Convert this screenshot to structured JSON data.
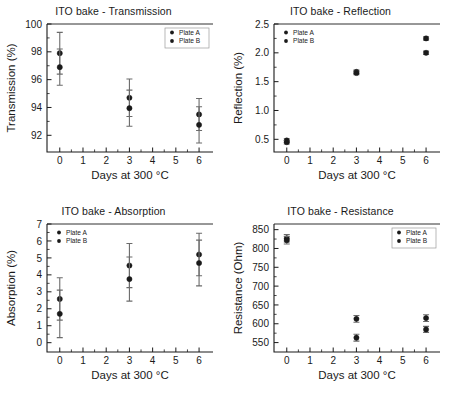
{
  "figure": {
    "width": 454,
    "height": 400,
    "background": "#ffffff",
    "marker_color": "#1a1a1a",
    "errorbar_color": "#6b6b6b",
    "axis_color": "#1a1a1a",
    "series_names": [
      "Plate A",
      "Plate B"
    ],
    "shared_xlabel": "Days at 300 °C"
  },
  "chart_data": [
    {
      "type": "scatter",
      "id": "transmission",
      "title": "ITO bake - Transmission",
      "xlabel": "Days at 300 °C",
      "ylabel": "Transmission (%)",
      "xlim": [
        -0.55,
        6.6
      ],
      "ylim": [
        90.8,
        100
      ],
      "xticks": [
        0,
        1,
        2,
        3,
        4,
        5,
        6
      ],
      "yticks": [
        92,
        94,
        96,
        98,
        100
      ],
      "ytick_labels": [
        "92",
        "94",
        "96",
        "98",
        "100"
      ],
      "grid": false,
      "legend": {
        "position": "top-right",
        "entries": [
          "Plate A",
          "Plate B"
        ]
      },
      "x": [
        0,
        3,
        6
      ],
      "series": [
        {
          "name": "Plate A",
          "values": [
            97.9,
            94.7,
            93.5
          ],
          "errors": [
            1.5,
            1.35,
            1.15
          ]
        },
        {
          "name": "Plate B",
          "values": [
            96.9,
            93.95,
            92.75
          ],
          "errors": [
            1.3,
            1.3,
            1.3
          ]
        }
      ]
    },
    {
      "type": "scatter",
      "id": "reflection",
      "title": "ITO bake - Reflection",
      "xlabel": "Days at 300 °C",
      "ylabel": "Reflection (%)",
      "xlim": [
        -0.55,
        6.6
      ],
      "ylim": [
        0.28,
        2.5
      ],
      "xticks": [
        0,
        1,
        2,
        3,
        4,
        5,
        6
      ],
      "yticks": [
        0.5,
        1.0,
        1.5,
        2.0,
        2.5
      ],
      "ytick_labels": [
        "0.5",
        "1.0",
        "1.5",
        "2.0",
        "2.5"
      ],
      "grid": false,
      "legend": {
        "position": "top-left",
        "entries": [
          "Plate A",
          "Plate B"
        ]
      },
      "x": [
        0,
        3,
        6
      ],
      "series": [
        {
          "name": "Plate A",
          "values": [
            0.48,
            1.67,
            2.25
          ],
          "errors": [
            0.03,
            0.03,
            0.03
          ]
        },
        {
          "name": "Plate B",
          "values": [
            0.45,
            1.65,
            2.0
          ],
          "errors": [
            0.03,
            0.03,
            0.03
          ]
        }
      ]
    },
    {
      "type": "scatter",
      "id": "absorption",
      "title": "ITO bake - Absorption",
      "xlabel": "Days at 300 °C",
      "ylabel": "Absorption (%)",
      "xlim": [
        -0.55,
        6.6
      ],
      "ylim": [
        -0.55,
        7
      ],
      "xticks": [
        0,
        1,
        2,
        3,
        4,
        5,
        6
      ],
      "yticks": [
        0,
        1,
        2,
        3,
        4,
        5,
        6,
        7
      ],
      "ytick_labels": [
        "0",
        "1",
        "2",
        "3",
        "4",
        "5",
        "6",
        "7"
      ],
      "grid": false,
      "legend": {
        "position": "top-left",
        "entries": [
          "Plate A",
          "Plate B"
        ]
      },
      "x": [
        0,
        3,
        6
      ],
      "series": [
        {
          "name": "Plate A",
          "values": [
            2.58,
            4.55,
            5.2
          ],
          "errors": [
            1.25,
            1.3,
            1.25
          ]
        },
        {
          "name": "Plate B",
          "values": [
            1.7,
            3.75,
            4.7
          ],
          "errors": [
            1.4,
            1.3,
            1.35
          ]
        }
      ]
    },
    {
      "type": "scatter",
      "id": "resistance",
      "title": "ITO bake - Resistance",
      "xlabel": "Days at 300 °C",
      "ylabel": "Resistance (Ohm)",
      "xlim": [
        -0.55,
        6.6
      ],
      "ylim": [
        525,
        865
      ],
      "xticks": [
        0,
        1,
        2,
        3,
        4,
        5,
        6
      ],
      "yticks": [
        550,
        600,
        650,
        700,
        750,
        800,
        850
      ],
      "ytick_labels": [
        "550",
        "600",
        "650",
        "700",
        "750",
        "800",
        "850"
      ],
      "grid": false,
      "legend": {
        "position": "top-right",
        "entries": [
          "Plate A",
          "Plate B"
        ]
      },
      "x": [
        0,
        3,
        6
      ],
      "series": [
        {
          "name": "Plate A",
          "values": [
            827,
            613,
            615
          ],
          "errors": [
            10,
            9,
            9
          ]
        },
        {
          "name": "Plate B",
          "values": [
            822,
            563,
            585
          ],
          "errors": [
            10,
            9,
            8
          ]
        }
      ]
    }
  ]
}
